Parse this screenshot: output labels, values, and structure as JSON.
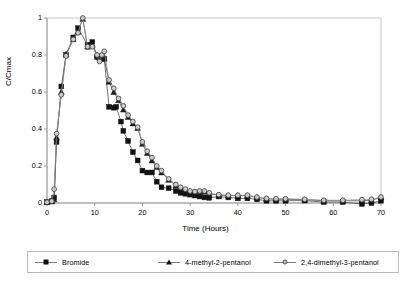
{
  "figure": {
    "kind": "scientific-line-chart",
    "background": "#ffffff"
  },
  "axis": {
    "x_title": "Time (Hours)",
    "y_title": "C/Cmax",
    "x_ticks": [
      "0",
      "10",
      "20",
      "30",
      "40",
      "50",
      "60",
      "70"
    ],
    "y_ticks": [
      "0",
      "0.2",
      "0.4",
      "0.6",
      "0.8",
      "1"
    ]
  },
  "legend": {
    "entries": [
      {
        "label": "Bromide",
        "marker": "filled-square",
        "color": "#111111"
      },
      {
        "label": "4-methyl-2-pentanol",
        "marker": "filled-triangle",
        "color": "#111111"
      },
      {
        "label": "2,4-dimethyl-3-pentanol",
        "marker": "open-circle",
        "color": "#c7c7c7"
      }
    ]
  },
  "chart_data": {
    "type": "line",
    "title": "",
    "xlabel": "Time (Hours)",
    "ylabel": "C/Cmax",
    "xlim": [
      0,
      70
    ],
    "ylim": [
      0,
      1
    ],
    "grid": false,
    "legend_position": "bottom",
    "series": [
      {
        "name": "Bromide",
        "marker": "filled-square",
        "color": "#111111",
        "points": [
          [
            0,
            0.005
          ],
          [
            1,
            0.01
          ],
          [
            1.5,
            0.03
          ],
          [
            2,
            0.33
          ],
          [
            3,
            0.63
          ],
          [
            4,
            0.8
          ],
          [
            5.5,
            0.895
          ],
          [
            6.5,
            0.945
          ],
          [
            8.5,
            0.855
          ],
          [
            9.5,
            0.87
          ],
          [
            10.5,
            0.79
          ],
          [
            11,
            0.785
          ],
          [
            11.5,
            0.785
          ],
          [
            12,
            0.78
          ],
          [
            13,
            0.52
          ],
          [
            14,
            0.515
          ],
          [
            14.5,
            0.52
          ],
          [
            15.5,
            0.44
          ],
          [
            16,
            0.39
          ],
          [
            17,
            0.335
          ],
          [
            18,
            0.275
          ],
          [
            19,
            0.23
          ],
          [
            20,
            0.175
          ],
          [
            21,
            0.165
          ],
          [
            22,
            0.165
          ],
          [
            23,
            0.115
          ],
          [
            24,
            0.085
          ],
          [
            25.5,
            0.08
          ],
          [
            27,
            0.065
          ],
          [
            28,
            0.055
          ],
          [
            29,
            0.05
          ],
          [
            30,
            0.045
          ],
          [
            31,
            0.04
          ],
          [
            32,
            0.035
          ],
          [
            33,
            0.03
          ],
          [
            34,
            0.028
          ],
          [
            36,
            0.035
          ],
          [
            38,
            0.03
          ],
          [
            40,
            0.025
          ],
          [
            42,
            0.025
          ],
          [
            44,
            0.02
          ],
          [
            46,
            0.012
          ],
          [
            48,
            0.012
          ],
          [
            50,
            0.012
          ],
          [
            54,
            0.013
          ],
          [
            58,
            0.005
          ],
          [
            62,
            0.005
          ],
          [
            66,
            -0.005
          ],
          [
            68,
            0.0
          ],
          [
            70,
            0.012
          ]
        ]
      },
      {
        "name": "4-methyl-2-pentanol",
        "marker": "filled-triangle",
        "color": "#111111",
        "points": [
          [
            0,
            0.004
          ],
          [
            1,
            0.008
          ],
          [
            1.5,
            0.02
          ],
          [
            2,
            0.355
          ],
          [
            3,
            0.6
          ],
          [
            4,
            0.805
          ],
          [
            5.5,
            0.885
          ],
          [
            6.5,
            0.925
          ],
          [
            7.5,
            0.995
          ],
          [
            8.5,
            0.845
          ],
          [
            9.5,
            0.855
          ],
          [
            10.5,
            0.8
          ],
          [
            11,
            0.79
          ],
          [
            11.5,
            0.785
          ],
          [
            12,
            0.78
          ],
          [
            13,
            0.655
          ],
          [
            14,
            0.6
          ],
          [
            15,
            0.555
          ],
          [
            16,
            0.505
          ],
          [
            17,
            0.465
          ],
          [
            18,
            0.43
          ],
          [
            19,
            0.405
          ],
          [
            20,
            0.32
          ],
          [
            21,
            0.27
          ],
          [
            22,
            0.23
          ],
          [
            23,
            0.195
          ],
          [
            24,
            0.165
          ],
          [
            25.5,
            0.125
          ],
          [
            27,
            0.095
          ],
          [
            28,
            0.08
          ],
          [
            29,
            0.07
          ],
          [
            30,
            0.06
          ],
          [
            31,
            0.058
          ],
          [
            32,
            0.055
          ],
          [
            33,
            0.06
          ],
          [
            34,
            0.05
          ],
          [
            36,
            0.042
          ],
          [
            38,
            0.04
          ],
          [
            40,
            0.04
          ],
          [
            42,
            0.04
          ],
          [
            44,
            0.03
          ],
          [
            46,
            0.022
          ],
          [
            48,
            0.02
          ],
          [
            50,
            0.02
          ],
          [
            54,
            0.018
          ],
          [
            58,
            0.012
          ],
          [
            62,
            0.012
          ],
          [
            66,
            0.012
          ],
          [
            68,
            0.015
          ],
          [
            70,
            0.03
          ]
        ]
      },
      {
        "name": "2,4-dimethyl-3-pentanol",
        "marker": "open-circle",
        "color": "#c7c7c7",
        "points": [
          [
            0,
            0.004
          ],
          [
            1,
            0.01
          ],
          [
            1.5,
            0.075
          ],
          [
            2,
            0.375
          ],
          [
            3,
            0.585
          ],
          [
            4,
            0.795
          ],
          [
            5.5,
            0.885
          ],
          [
            6.5,
            0.92
          ],
          [
            7.5,
            1.0
          ],
          [
            8.5,
            0.845
          ],
          [
            9.5,
            0.845
          ],
          [
            10.5,
            0.8
          ],
          [
            11,
            0.765
          ],
          [
            11.5,
            0.8
          ],
          [
            12,
            0.82
          ],
          [
            13,
            0.665
          ],
          [
            14,
            0.62
          ],
          [
            15,
            0.565
          ],
          [
            16,
            0.525
          ],
          [
            17,
            0.475
          ],
          [
            18,
            0.44
          ],
          [
            19,
            0.41
          ],
          [
            20,
            0.33
          ],
          [
            21,
            0.28
          ],
          [
            22,
            0.245
          ],
          [
            23,
            0.2
          ],
          [
            24,
            0.175
          ],
          [
            25.5,
            0.13
          ],
          [
            27,
            0.1
          ],
          [
            28,
            0.085
          ],
          [
            29,
            0.075
          ],
          [
            30,
            0.065
          ],
          [
            31,
            0.062
          ],
          [
            32,
            0.065
          ],
          [
            33,
            0.065
          ],
          [
            34,
            0.055
          ],
          [
            36,
            0.045
          ],
          [
            38,
            0.042
          ],
          [
            40,
            0.042
          ],
          [
            42,
            0.042
          ],
          [
            44,
            0.032
          ],
          [
            46,
            0.025
          ],
          [
            48,
            0.023
          ],
          [
            50,
            0.023
          ],
          [
            54,
            0.02
          ],
          [
            58,
            0.015
          ],
          [
            62,
            0.015
          ],
          [
            66,
            0.018
          ],
          [
            68,
            0.02
          ],
          [
            70,
            0.032
          ]
        ]
      }
    ]
  }
}
